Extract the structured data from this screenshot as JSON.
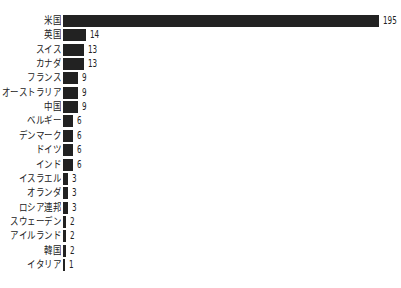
{
  "chart_data": {
    "type": "bar",
    "orientation": "horizontal",
    "title": "",
    "xlabel": "",
    "ylabel": "",
    "grid": false,
    "legend": null,
    "categories": [
      "米国",
      "英国",
      "スイス",
      "カナダ",
      "フランス",
      "オーストラリア",
      "中国",
      "ベルギー",
      "デンマーク",
      "ドイツ",
      "インド",
      "イスラエル",
      "オランダ",
      "ロシア連邦",
      "スウェーデン",
      "アイルランド",
      "韓国",
      "イタリア"
    ],
    "values": [
      195,
      14,
      13,
      13,
      9,
      9,
      9,
      6,
      6,
      6,
      6,
      3,
      3,
      3,
      2,
      2,
      2,
      1
    ],
    "bar_color": "#222222",
    "xlim": [
      0,
      195
    ]
  }
}
